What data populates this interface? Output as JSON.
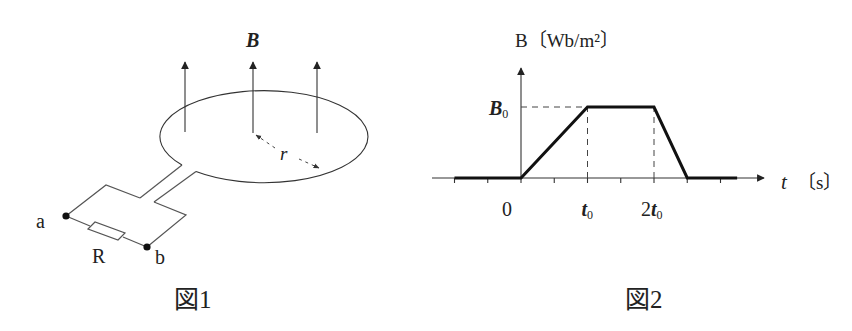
{
  "figure1": {
    "caption": "図1",
    "field_label": "B",
    "radius_label": "r",
    "terminal_a": "a",
    "terminal_b": "b",
    "resistor_label": "R"
  },
  "figure2": {
    "caption": "図2",
    "y_axis_label": "B〔Wb/m²〕",
    "x_axis_label_var": "t",
    "x_axis_label_unit": "〔s〕",
    "y_level_label_main": "B",
    "y_level_label_sub": "0"
  },
  "chart_data": {
    "type": "line",
    "title": "",
    "xlabel": "t〔s〕",
    "ylabel": "B〔Wb/m²〕",
    "x_unit": "t0",
    "x_ticks": [
      -1,
      -0.5,
      0,
      0.5,
      1,
      1.5,
      2,
      2.5,
      3
    ],
    "x_tick_labels": [
      {
        "x": 0,
        "label": "0"
      },
      {
        "x": 1,
        "label": "t0"
      },
      {
        "x": 2,
        "label": "2t0"
      }
    ],
    "y_tick_labels": [
      {
        "y": 1,
        "label": "B0"
      }
    ],
    "xlim": [
      -1.3,
      3.6
    ],
    "ylim": [
      0,
      1.6
    ],
    "series": [
      {
        "name": "B",
        "x": [
          -1,
          0,
          1,
          2,
          2.5,
          3.25
        ],
        "y": [
          0,
          0,
          1,
          1,
          0,
          0
        ]
      }
    ],
    "guides": [
      {
        "type": "hline",
        "y": 1,
        "from_x": 0,
        "to_x": 1,
        "style": "dashed"
      },
      {
        "type": "vline",
        "x": 1,
        "from_y": 0,
        "to_y": 1,
        "style": "dashed"
      },
      {
        "type": "vline",
        "x": 2,
        "from_y": 0,
        "to_y": 1,
        "style": "dashed"
      }
    ],
    "grid": false,
    "legend": "none"
  }
}
